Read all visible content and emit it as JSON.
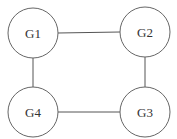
{
  "diagram": {
    "nodes": [
      {
        "id": "G1",
        "label": "G1",
        "cx": 33,
        "cy": 33
      },
      {
        "id": "G2",
        "label": "G2",
        "cx": 145,
        "cy": 32
      },
      {
        "id": "G3",
        "label": "G3",
        "cx": 145,
        "cy": 112
      },
      {
        "id": "G4",
        "label": "G4",
        "cx": 33,
        "cy": 112
      }
    ],
    "edges": [
      {
        "from": "G1",
        "to": "G2"
      },
      {
        "from": "G2",
        "to": "G3"
      },
      {
        "from": "G3",
        "to": "G4"
      },
      {
        "from": "G4",
        "to": "G1"
      }
    ],
    "node_radius": 25
  }
}
